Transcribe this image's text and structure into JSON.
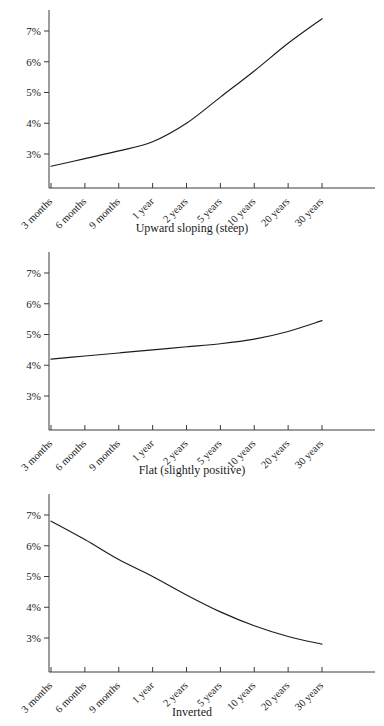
{
  "figure": {
    "title": "",
    "background_color": "#ffffff",
    "line_color": "#1c1c1c",
    "axis_color": "#3a3a3a"
  },
  "axis": {
    "y_tick_labels": [
      "7%",
      "6%",
      "5%",
      "4%",
      "3%"
    ],
    "y_tick_values": [
      7,
      6,
      5,
      4,
      3
    ],
    "x_tick_labels": [
      "3 months",
      "6 months",
      "9 months",
      "1 year",
      "2 years",
      "5 years",
      "10 years",
      "20 years",
      "30 years"
    ],
    "x_label_rotation": -45
  },
  "chart_data": [
    {
      "type": "line",
      "title": "Upward sloping (steep)",
      "xlabel": "",
      "ylabel": "",
      "categories": [
        "3 months",
        "6 months",
        "9 months",
        "1 year",
        "2 years",
        "5 years",
        "10 years",
        "20 years",
        "30 years"
      ],
      "values": [
        2.6,
        2.85,
        3.1,
        3.4,
        4.0,
        4.85,
        5.7,
        6.6,
        7.4
      ],
      "ylim": [
        2.2,
        7.6
      ],
      "grid": false,
      "legend": "none"
    },
    {
      "type": "line",
      "title": "Flat (slightly positive)",
      "xlabel": "",
      "ylabel": "",
      "categories": [
        "3 months",
        "6 months",
        "9 months",
        "1 year",
        "2 years",
        "5 years",
        "10 years",
        "20 years",
        "30 years"
      ],
      "values": [
        4.2,
        4.3,
        4.4,
        4.5,
        4.6,
        4.7,
        4.85,
        5.1,
        5.45
      ],
      "ylim": [
        2.2,
        7.6
      ],
      "grid": false,
      "legend": "none"
    },
    {
      "type": "line",
      "title": "Inverted",
      "xlabel": "",
      "ylabel": "",
      "categories": [
        "3 months",
        "6 months",
        "9 months",
        "1 year",
        "2 years",
        "5 years",
        "10 years",
        "20 years",
        "30 years"
      ],
      "values": [
        6.8,
        6.2,
        5.55,
        5.0,
        4.4,
        3.85,
        3.4,
        3.05,
        2.8
      ],
      "ylim": [
        2.2,
        7.6
      ],
      "grid": false,
      "legend": "none"
    }
  ]
}
